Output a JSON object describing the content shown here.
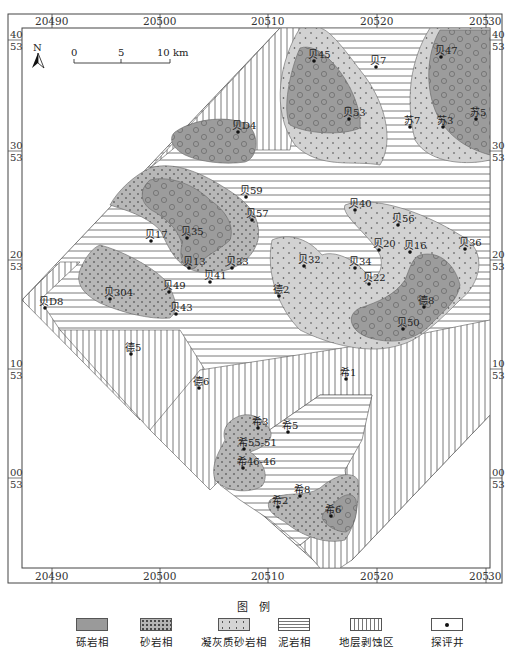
{
  "map": {
    "top_axis_labels": [
      {
        "major": "204",
        "minor": "90"
      },
      {
        "major": "205",
        "minor": "00"
      },
      {
        "major": "205",
        "minor": "10"
      },
      {
        "major": "205",
        "minor": "20"
      },
      {
        "major": "205",
        "minor": "30"
      }
    ],
    "bottom_axis_labels": [
      {
        "major": "204",
        "minor": "90"
      },
      {
        "major": "205",
        "minor": "00"
      },
      {
        "major": "205",
        "minor": "10"
      },
      {
        "major": "205",
        "minor": "20"
      },
      {
        "major": "205",
        "minor": "30"
      }
    ],
    "side_axis_labels": [
      {
        "top": "40",
        "bottom": "53"
      },
      {
        "top": "30",
        "bottom": "53"
      },
      {
        "top": "20",
        "bottom": "53"
      },
      {
        "top": "10",
        "bottom": "53"
      },
      {
        "top": "00",
        "bottom": "53"
      }
    ],
    "north_arrow": "N",
    "scale_bar": {
      "ticks": [
        "0",
        "5",
        "10 km"
      ]
    },
    "wells": [
      {
        "name": "贝45",
        "x": 314,
        "y": 61
      },
      {
        "name": "贝7",
        "x": 376,
        "y": 67
      },
      {
        "name": "贝47",
        "x": 441,
        "y": 57
      },
      {
        "name": "贝53",
        "x": 349,
        "y": 119
      },
      {
        "name": "贝D4",
        "x": 238,
        "y": 132
      },
      {
        "name": "苏7",
        "x": 410,
        "y": 127
      },
      {
        "name": "苏3",
        "x": 443,
        "y": 127
      },
      {
        "name": "苏5",
        "x": 476,
        "y": 119
      },
      {
        "name": "贝59",
        "x": 246,
        "y": 197
      },
      {
        "name": "贝57",
        "x": 252,
        "y": 220
      },
      {
        "name": "贝17",
        "x": 151,
        "y": 241
      },
      {
        "name": "贝35",
        "x": 187,
        "y": 238
      },
      {
        "name": "贝40",
        "x": 355,
        "y": 210
      },
      {
        "name": "贝56",
        "x": 398,
        "y": 225
      },
      {
        "name": "贝20",
        "x": 379,
        "y": 250
      },
      {
        "name": "贝16",
        "x": 410,
        "y": 252
      },
      {
        "name": "贝36",
        "x": 465,
        "y": 249
      },
      {
        "name": "贝32",
        "x": 304,
        "y": 266
      },
      {
        "name": "贝34",
        "x": 355,
        "y": 268
      },
      {
        "name": "贝22",
        "x": 369,
        "y": 284
      },
      {
        "name": "贝13",
        "x": 189,
        "y": 268
      },
      {
        "name": "贝33",
        "x": 232,
        "y": 268
      },
      {
        "name": "贝41",
        "x": 210,
        "y": 282
      },
      {
        "name": "贝49",
        "x": 169,
        "y": 292
      },
      {
        "name": "贝304",
        "x": 110,
        "y": 299
      },
      {
        "name": "贝D8",
        "x": 45,
        "y": 308
      },
      {
        "name": "贝43",
        "x": 176,
        "y": 314
      },
      {
        "name": "德2",
        "x": 279,
        "y": 296
      },
      {
        "name": "德8",
        "x": 424,
        "y": 307
      },
      {
        "name": "贝50",
        "x": 403,
        "y": 329
      },
      {
        "name": "德5",
        "x": 131,
        "y": 354
      },
      {
        "name": "德6",
        "x": 199,
        "y": 388
      },
      {
        "name": "希1",
        "x": 346,
        "y": 379
      },
      {
        "name": "希3",
        "x": 258,
        "y": 428
      },
      {
        "name": "希5",
        "x": 288,
        "y": 432
      },
      {
        "name": "希55-51",
        "x": 244,
        "y": 449
      },
      {
        "name": "希46-46",
        "x": 243,
        "y": 468
      },
      {
        "name": "希8",
        "x": 300,
        "y": 496
      },
      {
        "name": "希2",
        "x": 278,
        "y": 507
      },
      {
        "name": "希6",
        "x": 331,
        "y": 516
      }
    ]
  },
  "legend": {
    "title": "图 例",
    "items": [
      {
        "key": "gravel",
        "label": "砾岩相"
      },
      {
        "key": "sand",
        "label": "砂岩相"
      },
      {
        "key": "tuff",
        "label": "凝灰质砂岩相"
      },
      {
        "key": "mud",
        "label": "泥岩相"
      },
      {
        "key": "eroded",
        "label": "地层剥蚀区"
      },
      {
        "key": "well",
        "label": "探评井"
      }
    ]
  },
  "colors": {
    "gravel": "#9a9a9a",
    "sand": "#b4b4b4",
    "tuff": "#d2d2d2",
    "stripe": "#7a7a7a",
    "frame": "#444444"
  }
}
